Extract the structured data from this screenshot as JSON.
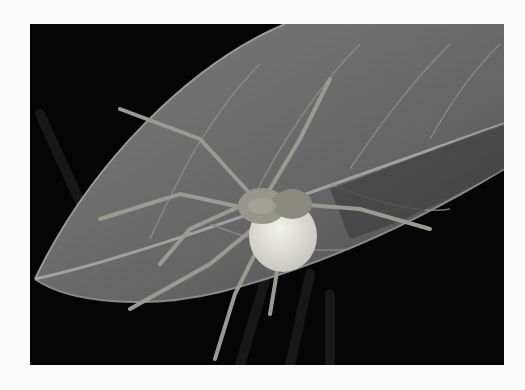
{
  "image": {
    "subject": "spider on a leaf carrying a white egg sac",
    "style": "grayscale macro photograph",
    "colors": {
      "background": "#050505",
      "leaf": "#6e6e6e",
      "leaf_vein": "#9a9a9a",
      "spider": "#8f8f86",
      "egg_sac": "#e2e2da",
      "margin": "#fbfbfb"
    }
  }
}
